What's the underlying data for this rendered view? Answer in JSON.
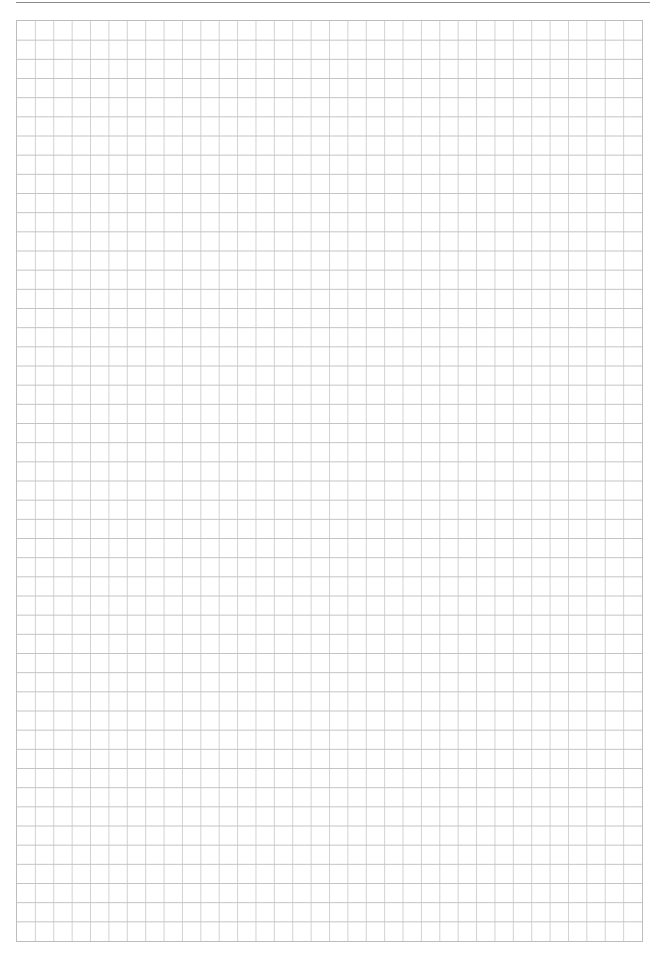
{
  "page": {
    "type": "graph-paper",
    "header": {
      "text": "",
      "rule_color": "#8a8a8a"
    },
    "grid": {
      "columns": 34,
      "rows": 48,
      "line_color_vertical": "#d2d2d2",
      "line_color_horizontal": "#c4c4c4",
      "border_color": "#bdbdbd",
      "background": "#ffffff"
    },
    "footer": {
      "text": ""
    }
  }
}
